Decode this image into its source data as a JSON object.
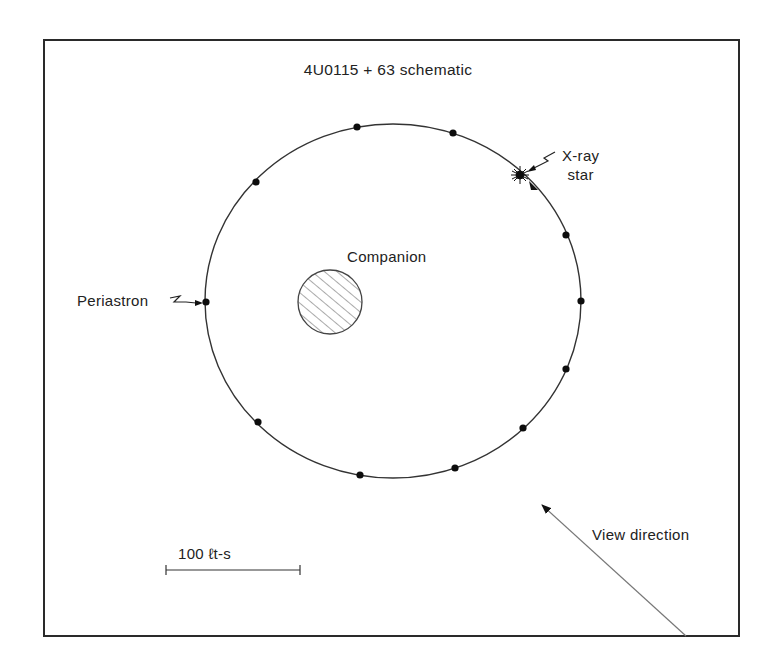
{
  "diagram": {
    "title": "4U0115 + 63 schematic",
    "labels": {
      "companion": "Companion",
      "periastron": "Periastron",
      "xray_star_line1": "X-ray",
      "xray_star_line2": "star",
      "view_direction": "View direction",
      "scale_bar": "100 ℓt-s"
    },
    "frame": {
      "x": 44,
      "y": 40,
      "width": 695,
      "height": 596,
      "stroke": "#2a2a2a"
    },
    "orbit": {
      "cx": 393,
      "cy": 301,
      "rx": 188,
      "ry": 177,
      "stroke": "#333333",
      "direction": "clockwise"
    },
    "companion_star": {
      "cx": 330,
      "cy": 302,
      "r": 32,
      "fill": "hatched"
    },
    "orbit_phase_points": [
      {
        "x": 206,
        "y": 302,
        "label": "Periastron"
      },
      {
        "x": 256,
        "y": 182
      },
      {
        "x": 357,
        "y": 127
      },
      {
        "x": 453,
        "y": 133
      },
      {
        "x": 566,
        "y": 235
      },
      {
        "x": 581,
        "y": 301
      },
      {
        "x": 566,
        "y": 369
      },
      {
        "x": 523,
        "y": 428
      },
      {
        "x": 455,
        "y": 468
      },
      {
        "x": 360,
        "y": 475
      },
      {
        "x": 258,
        "y": 422
      }
    ],
    "xray_star_position": {
      "x": 520,
      "y": 175
    },
    "view_arrow": {
      "x1": 686,
      "y1": 636,
      "x2": 540,
      "y2": 503
    },
    "scale_bar_line": {
      "x1": 166,
      "x2": 300,
      "y": 570
    }
  }
}
